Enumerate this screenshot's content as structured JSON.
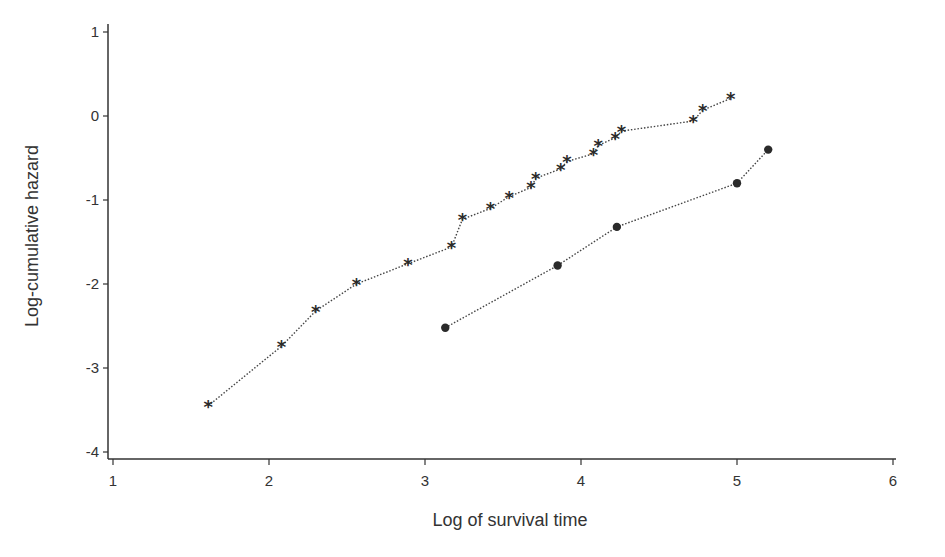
{
  "chart_data": {
    "type": "line",
    "title": "",
    "xlabel": "Log of survival time",
    "ylabel": "Log-cumulative hazard",
    "xlim": [
      1,
      6
    ],
    "ylim": [
      -4,
      1
    ],
    "xticks": [
      1,
      2,
      3,
      4,
      5,
      6
    ],
    "yticks": [
      -4,
      -3,
      -2,
      -1,
      0,
      1
    ],
    "grid": false,
    "legend": null,
    "series": [
      {
        "name": "Group 1",
        "marker": "asterisk",
        "line_style": "dotted",
        "x": [
          1.61,
          2.08,
          2.3,
          2.56,
          2.89,
          3.17,
          3.24,
          3.42,
          3.54,
          3.68,
          3.71,
          3.87,
          3.91,
          4.08,
          4.11,
          4.22,
          4.26,
          4.72,
          4.78,
          4.96
        ],
        "y": [
          -3.45,
          -2.74,
          -2.32,
          -2.0,
          -1.76,
          -1.56,
          -1.23,
          -1.1,
          -0.96,
          -0.85,
          -0.74,
          -0.63,
          -0.54,
          -0.45,
          -0.35,
          -0.26,
          -0.18,
          -0.06,
          0.07,
          0.21
        ]
      },
      {
        "name": "Group 2",
        "marker": "filled-circle",
        "line_style": "dotted",
        "x": [
          3.13,
          3.85,
          4.23,
          5.0,
          5.2
        ],
        "y": [
          -2.52,
          -1.78,
          -1.32,
          -0.8,
          -0.4
        ]
      }
    ]
  },
  "colors": {
    "axis": "#333333",
    "line": "#444444",
    "marker": "#2a2a2a"
  }
}
